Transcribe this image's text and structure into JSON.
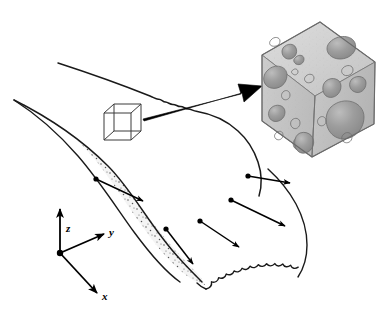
{
  "figure": {
    "name": "multiscale-porous-flow-diagram",
    "background_color": "#ffffff",
    "width": 390,
    "height": 313
  },
  "axes": {
    "origin": [
      60,
      253
    ],
    "labels": {
      "z": "z",
      "y": "y",
      "x": "x"
    },
    "z_tip": [
      60,
      207
    ],
    "y_tip": [
      107,
      232
    ],
    "x_tip": [
      100,
      296
    ],
    "color": "#000000"
  },
  "macro_body": {
    "name": "flow-body",
    "outline_color": "#000000",
    "stipple_fill": "#f2f2f2",
    "stipple_dot_color": "#4d4d4d",
    "description": "elongated tapering lobe with stippled interior and scalloped front margin"
  },
  "rev_cube": {
    "name": "wireframe-rev-cube",
    "x": 104,
    "y": 104,
    "size": 26,
    "depth": 10,
    "stroke": "#3a3a3a"
  },
  "zoom_arrow": {
    "name": "magnification-arrow",
    "from": [
      143,
      118
    ],
    "to": [
      258,
      87
    ],
    "color": "#000000"
  },
  "micro_cube": {
    "name": "microstructure-cube",
    "face_color": "#c9c9c9",
    "top_color": "#d4d4d4",
    "right_color": "#bdbdbd",
    "pore_color": "#9a9a9a",
    "pore_edge": "#6e6e6e",
    "outline": "#777777",
    "top_vertex": [
      320,
      22
    ],
    "left_vertex": [
      262,
      55
    ],
    "right_vertex": [
      375,
      62
    ],
    "bottom_vertex": [
      312,
      157
    ]
  },
  "flow_arrows": [
    {
      "name": "flow-arrow-1",
      "from": [
        96,
        179
      ],
      "to": [
        147,
        203
      ]
    },
    {
      "name": "flow-arrow-2",
      "from": [
        166,
        229
      ],
      "to": [
        196,
        267
      ]
    },
    {
      "name": "flow-arrow-3",
      "from": [
        200,
        221
      ],
      "to": [
        243,
        250
      ]
    },
    {
      "name": "flow-arrow-4",
      "from": [
        231,
        200
      ],
      "to": [
        289,
        229
      ]
    },
    {
      "name": "flow-arrow-5",
      "from": [
        248,
        176
      ],
      "to": [
        294,
        184
      ]
    }
  ]
}
